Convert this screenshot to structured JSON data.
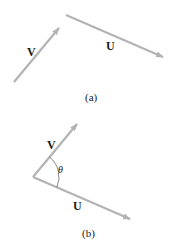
{
  "figure_a": {
    "caption": "(a)",
    "vectors": [
      {
        "name": "V",
        "label": "V",
        "from": [
          14,
          82
        ],
        "to": [
          59,
          28
        ]
      },
      {
        "name": "U",
        "label": "U",
        "from": [
          66,
          15
        ],
        "to": [
          163,
          57
        ]
      }
    ]
  },
  "figure_b": {
    "caption": "(b)",
    "angle_label": "θ",
    "vectors": [
      {
        "name": "V",
        "label": "V",
        "from": [
          33,
          177
        ],
        "to": [
          77,
          124
        ]
      },
      {
        "name": "U",
        "label": "U",
        "from": [
          33,
          177
        ],
        "to": [
          130,
          219
        ]
      }
    ]
  },
  "colors": {
    "arrow": "#b3b3b3",
    "text": "#1a1a1a",
    "arc": "#555555"
  }
}
